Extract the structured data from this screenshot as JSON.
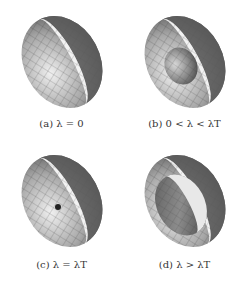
{
  "figure": {
    "panels": [
      {
        "id": "a",
        "label": "(a)",
        "condition": "λ = 0",
        "caption": "(a) λ = 0",
        "inner_shell": "none"
      },
      {
        "id": "b",
        "label": "(b)",
        "condition": "0 < λ < λT",
        "caption": "(b) 0 < λ < λT",
        "inner_shell": "small"
      },
      {
        "id": "c",
        "label": "(c)",
        "condition": "λ = λT",
        "caption": "(c) λ = λT",
        "inner_shell": "point"
      },
      {
        "id": "d",
        "label": "(d)",
        "condition": "λ > λT",
        "caption": "(d) λ > λT",
        "inner_shell": "large"
      }
    ],
    "colors": {
      "shell_light": "#e6e6e6",
      "shell_dark": "#5a5a5a",
      "mesh_line": "#3a3a3a",
      "rim_band": "#f2f2f2",
      "caption_text": "#333333"
    }
  }
}
